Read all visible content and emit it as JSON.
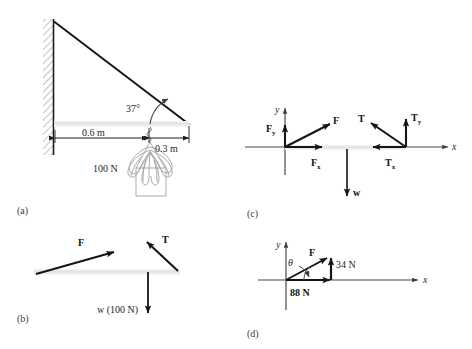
{
  "figure": {
    "panels": [
      {
        "id": "a",
        "label": "(a)",
        "name": "panel-a-physical-setup",
        "annotations": {
          "angle": "37°",
          "dim_left": "0.6 m",
          "dim_right": "0.3 m",
          "weight": "100 N"
        }
      },
      {
        "id": "b",
        "label": "(b)",
        "name": "panel-b-free-body-on-strut",
        "annotations": {
          "force_f": "F",
          "force_t": "T",
          "weight": "w (100 N)"
        }
      },
      {
        "id": "c",
        "label": "(c)",
        "name": "panel-c-components-diagram",
        "annotations": {
          "axis_x": "x",
          "axis_y": "y",
          "f": "F",
          "fx": "F",
          "fx_sub": "x",
          "fy": "F",
          "fy_sub": "y",
          "t": "T",
          "tx": "T",
          "tx_sub": "x",
          "ty": "T",
          "ty_sub": "y",
          "w": "w"
        }
      },
      {
        "id": "d",
        "label": "(d)",
        "name": "panel-d-resultant-force",
        "annotations": {
          "axis_x": "x",
          "axis_y": "y",
          "f": "F",
          "theta": "θ",
          "vertical_component": "34 N",
          "horizontal_component": "88 N"
        }
      }
    ],
    "colors": {
      "ink": "#1a1a1a",
      "arrow": "#151515",
      "strut": "#e8e8e8",
      "wall_hatch": "#8a8a8a",
      "axis": "#4a4a4a",
      "plant": "#9a9a9a"
    }
  }
}
